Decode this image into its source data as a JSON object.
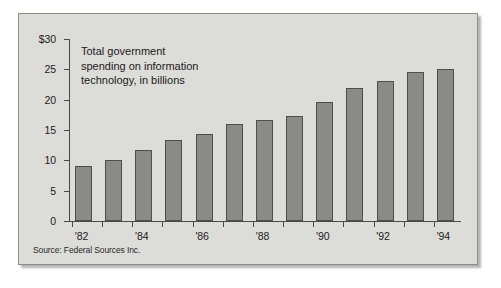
{
  "figure": {
    "title_lines": [
      "Total government",
      "spending on information",
      "technology, in billions"
    ],
    "title_text": "Total government spending on information technology, in billions",
    "source_note": "Source: Federal Sources Inc.",
    "background_color": "#dcdcd8",
    "bar_color": "#8a8a88",
    "bar_edge_color": "#4e4e4c",
    "axis_color": "#4a4a48",
    "text_color": "#1b1b1b"
  },
  "chart_data": {
    "type": "bar",
    "title": "Total government spending on information technology, in billions",
    "xlabel": "",
    "ylabel": "",
    "ylim": [
      0,
      30
    ],
    "ytick_values": [
      0,
      5,
      10,
      15,
      20,
      25,
      30
    ],
    "ytick_labels": [
      "0",
      "5",
      "10",
      "15",
      "20",
      "25",
      "$30"
    ],
    "grid": false,
    "legend": false,
    "categories": [
      "'82",
      "'83",
      "'84",
      "'85",
      "'86",
      "'87",
      "'88",
      "'89",
      "'90",
      "'91",
      "'92",
      "'93",
      "'94"
    ],
    "xtick_labels_shown": [
      "'82",
      "'84",
      "'86",
      "'88",
      "'90",
      "'92",
      "'94"
    ],
    "values": [
      9,
      10,
      11.7,
      13.3,
      14.3,
      16,
      16.6,
      17.3,
      19.7,
      22,
      23,
      24.5,
      25
    ],
    "units": "billions of dollars",
    "source": "Federal Sources Inc."
  }
}
